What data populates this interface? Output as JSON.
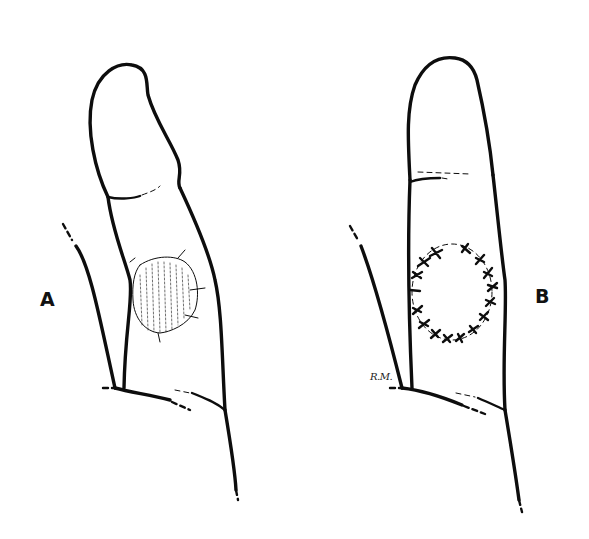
{
  "figure": {
    "panels": [
      {
        "id": "A",
        "label": "A",
        "description": "finger with circular skin defect (wound) on volar/lateral surface"
      },
      {
        "id": "B",
        "label": "B",
        "description": "finger with circular graft sutured in place with interrupted sutures"
      }
    ],
    "artist_signature": "R.M.",
    "colors": {
      "line": "#0d0d0d",
      "background": "#ffffff"
    }
  }
}
